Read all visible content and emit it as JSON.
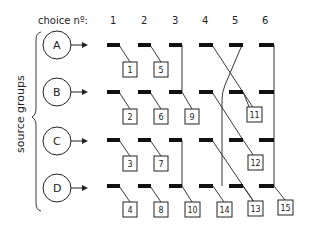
{
  "header": {
    "choice_label": "choice nº:",
    "choices": [
      "1",
      "2",
      "3",
      "4",
      "5",
      "6"
    ]
  },
  "side_label": "source groups",
  "groups": [
    "A",
    "B",
    "C",
    "D"
  ],
  "boxes": {
    "b1": "1",
    "b2": "2",
    "b3": "3",
    "b4": "4",
    "b5": "5",
    "b6": "6",
    "b7": "7",
    "b8": "8",
    "b9": "9",
    "b10": "10",
    "b11": "11",
    "b12": "12",
    "b13": "13",
    "b14": "14",
    "b15": "15"
  },
  "colors": {
    "ink": "#111111",
    "background": "#ffffff"
  }
}
